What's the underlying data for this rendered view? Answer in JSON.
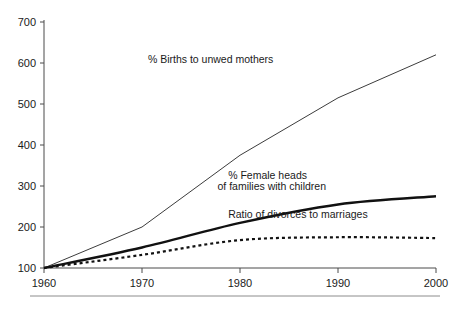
{
  "chart_data": {
    "type": "line",
    "title": "",
    "subtitle": "",
    "xlabel": "",
    "ylabel": "",
    "xlim": [
      1960,
      2000
    ],
    "ylim": [
      100,
      700
    ],
    "grid": false,
    "legend_position": "inline-annotations",
    "x_ticks": [
      "1960",
      "1970",
      "1980",
      "1990",
      "2000"
    ],
    "y_ticks": [
      "100",
      "200",
      "300",
      "400",
      "500",
      "600",
      "700"
    ],
    "x": [
      1960,
      1970,
      1980,
      1990,
      2000
    ],
    "series": [
      {
        "name": "% Births to unwed mothers",
        "style": "thin-solid",
        "values": [
          100,
          200,
          375,
          515,
          620
        ],
        "annotation": "% Births to unwed mothers"
      },
      {
        "name": "% Female heads of families with children",
        "style": "bold-solid",
        "values": [
          100,
          150,
          210,
          255,
          275
        ],
        "annotation_line1": "% Female heads",
        "annotation_line2": "of families with children"
      },
      {
        "name": "Ratio of divorces to marriages",
        "style": "dotted",
        "values": [
          100,
          132,
          168,
          175,
          173
        ],
        "annotation": "Ratio of divorces to marriages"
      }
    ],
    "annotations": [
      {
        "text": "% Births to unwed mothers",
        "x": 1970.6,
        "y": 600
      },
      {
        "text": "% Female heads",
        "x": 1978.8,
        "y": 318
      },
      {
        "text": "of families with children",
        "x": 1977.7,
        "y": 290
      },
      {
        "text": "Ratio of divorces to marriages",
        "x": 1978.8,
        "y": 222
      }
    ],
    "colors": {
      "axis": "#4a4a4a",
      "series_thin": "#3c3c3c",
      "series_bold": "#111111",
      "series_dotted": "#111111",
      "text": "#1a1a1a",
      "background": "#ffffff",
      "footer_rule": "#8c8c8c"
    }
  }
}
